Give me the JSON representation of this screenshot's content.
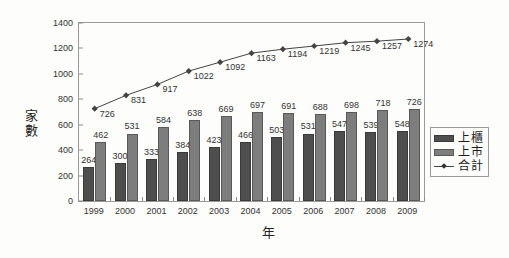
{
  "chart_data": {
    "type": "bar",
    "title": "",
    "xlabel": "年",
    "ylabel": "家數",
    "ylim": [
      0,
      1400
    ],
    "ytick_step": 200,
    "yticks": [
      0,
      200,
      400,
      600,
      800,
      1000,
      1200,
      1400
    ],
    "grid": false,
    "legend_position": "right",
    "categories": [
      "1999",
      "2000",
      "2001",
      "2002",
      "2003",
      "2004",
      "2005",
      "2006",
      "2007",
      "2008",
      "2009"
    ],
    "series": [
      {
        "name": "上櫃",
        "type": "bar",
        "color": "#4e4e4e",
        "values": [
          264,
          300,
          333,
          384,
          423,
          466,
          503,
          531,
          547,
          539,
          548
        ]
      },
      {
        "name": "上市",
        "type": "bar",
        "color": "#7d7d7d",
        "values": [
          462,
          531,
          584,
          638,
          669,
          697,
          691,
          688,
          698,
          718,
          726
        ]
      },
      {
        "name": "合計",
        "type": "line",
        "color": "#444444",
        "values": [
          726,
          831,
          917,
          1022,
          1092,
          1163,
          1194,
          1219,
          1245,
          1257,
          1274
        ]
      }
    ]
  },
  "axes": {
    "y_title": "家數",
    "x_title": "年",
    "y_tick_labels": [
      "0",
      "200",
      "400",
      "600",
      "800",
      "1000",
      "1200",
      "1400"
    ],
    "x_tick_labels": [
      "1999",
      "2000",
      "2001",
      "2002",
      "2003",
      "2004",
      "2005",
      "2006",
      "2007",
      "2008",
      "2009"
    ]
  },
  "legend": {
    "items": [
      {
        "label": "上櫃",
        "marker": "square-dark"
      },
      {
        "label": "上市",
        "marker": "square-gray"
      },
      {
        "label": "合計",
        "marker": "line-diamond"
      }
    ]
  }
}
